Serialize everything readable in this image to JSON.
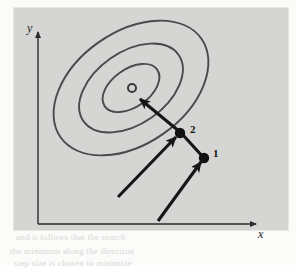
{
  "figure": {
    "kind": "contour-optimization-diagram",
    "background_color": "#fbfbfa",
    "panel_color": "#d5d5d3",
    "ink_color": "#3f3f3f",
    "arrow_color": "#161616",
    "page_ghost_lines": [
      "and it follows that the search",
      "the minimum along the direction",
      "step size is chosen to minimize"
    ]
  },
  "axes": {
    "x_label": "x",
    "y_label": "y",
    "x_axis_name": "horizontal-axis",
    "y_axis_name": "vertical-axis",
    "arrowhead_icon": "arrowhead-icon"
  },
  "contours": {
    "label": "elliptical contour lines",
    "count": 3,
    "rotation_deg": -35,
    "center": {
      "x": 131,
      "y": 88
    },
    "rings": [
      {
        "name": "contour-outer",
        "rx": 86,
        "ry": 56
      },
      {
        "name": "contour-middle",
        "rx": 58,
        "ry": 36
      },
      {
        "name": "contour-inner",
        "rx": 32,
        "ry": 19
      }
    ]
  },
  "optimum_marker": {
    "name": "optimum-point",
    "icon": "open-circle-icon",
    "x": 132,
    "y": 88,
    "radius": 4
  },
  "points": [
    {
      "id": "point-1",
      "label": "1",
      "x": 204,
      "y": 158,
      "label_x": 213,
      "label_y": 157
    },
    {
      "id": "point-2",
      "label": "2",
      "x": 180,
      "y": 133,
      "label_x": 190,
      "label_y": 133
    }
  ],
  "vectors": [
    {
      "name": "search-direction-to-point-1",
      "from": {
        "x": 158,
        "y": 221
      },
      "to": {
        "x": 202,
        "y": 161
      }
    },
    {
      "name": "search-direction-to-point-2",
      "from": {
        "x": 118,
        "y": 197
      },
      "to": {
        "x": 177,
        "y": 136
      }
    },
    {
      "name": "step-from-point-1-to-point-2",
      "from": {
        "x": 203,
        "y": 157
      },
      "to": {
        "x": 182,
        "y": 134
      }
    },
    {
      "name": "search-direction-to-optimum",
      "from": {
        "x": 180,
        "y": 132
      },
      "to": {
        "x": 139,
        "y": 98
      }
    }
  ]
}
